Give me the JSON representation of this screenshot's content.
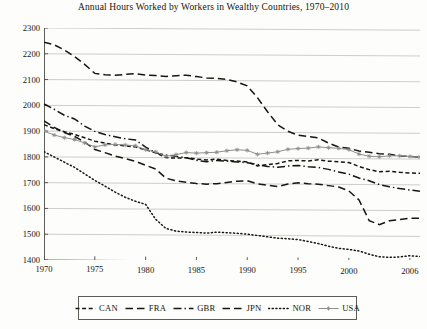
{
  "chart_data": {
    "type": "line",
    "title": "Annual Hours Worked by Workers in Wealthy Countries, 1970–2010",
    "xlabel": "",
    "ylabel": "",
    "xlim": [
      1970,
      2007
    ],
    "ylim": [
      1400,
      2300
    ],
    "ytick_labels": [
      "2300",
      "2200",
      "2100",
      "2000",
      "1900",
      "1800",
      "1700",
      "1600",
      "1500",
      "1400"
    ],
    "ytick_values": [
      2300,
      2200,
      2100,
      2000,
      1900,
      1800,
      1700,
      1600,
      1500,
      1400
    ],
    "xtick_labels": [
      "1970",
      "1975",
      "1980",
      "1985",
      "1990",
      "1995",
      "2000",
      "2006"
    ],
    "xtick_values": [
      1970,
      1975,
      1980,
      1985,
      1990,
      1995,
      2000,
      2006
    ],
    "grid": "horizontal",
    "legend_position": "below-axes",
    "x": [
      1970,
      1971,
      1972,
      1973,
      1974,
      1975,
      1976,
      1977,
      1978,
      1979,
      1980,
      1981,
      1982,
      1983,
      1984,
      1985,
      1986,
      1987,
      1988,
      1989,
      1990,
      1991,
      1992,
      1993,
      1994,
      1995,
      1996,
      1997,
      1998,
      1999,
      2000,
      2001,
      2002,
      2003,
      2004,
      2005,
      2006,
      2007
    ],
    "series": [
      {
        "name": "CAN",
        "style": "short-dash",
        "color": "#16160f",
        "values": [
          1925,
          1910,
          1898,
          1888,
          1875,
          1862,
          1855,
          1848,
          1845,
          1840,
          1830,
          1818,
          1800,
          1798,
          1800,
          1795,
          1792,
          1795,
          1790,
          1788,
          1785,
          1770,
          1775,
          1780,
          1790,
          1792,
          1790,
          1795,
          1790,
          1788,
          1785,
          1770,
          1758,
          1750,
          1752,
          1748,
          1746,
          1745
        ]
      },
      {
        "name": "FRA",
        "style": "long-dash",
        "color": "#16160f",
        "values": [
          1940,
          1915,
          1895,
          1880,
          1858,
          1830,
          1818,
          1805,
          1795,
          1785,
          1770,
          1755,
          1720,
          1710,
          1705,
          1700,
          1698,
          1700,
          1705,
          1710,
          1712,
          1700,
          1695,
          1690,
          1700,
          1705,
          1702,
          1700,
          1695,
          1690,
          1675,
          1640,
          1560,
          1545,
          1560,
          1565,
          1570,
          1570
        ]
      },
      {
        "name": "GBR",
        "style": "dash-dot",
        "color": "#16160f",
        "values": [
          2005,
          1985,
          1962,
          1948,
          1920,
          1900,
          1888,
          1880,
          1872,
          1868,
          1840,
          1818,
          1810,
          1805,
          1800,
          1790,
          1785,
          1790,
          1788,
          1785,
          1782,
          1775,
          1768,
          1765,
          1770,
          1772,
          1768,
          1765,
          1758,
          1748,
          1740,
          1725,
          1715,
          1700,
          1692,
          1685,
          1680,
          1675
        ]
      },
      {
        "name": "JPN",
        "style": "long-dash",
        "color": "#16160f",
        "values": [
          2245,
          2235,
          2215,
          2190,
          2160,
          2125,
          2120,
          2118,
          2122,
          2125,
          2120,
          2118,
          2115,
          2118,
          2120,
          2115,
          2110,
          2108,
          2105,
          2095,
          2080,
          2035,
          1980,
          1930,
          1905,
          1890,
          1885,
          1880,
          1860,
          1845,
          1840,
          1830,
          1825,
          1820,
          1818,
          1812,
          1810,
          1808
        ]
      },
      {
        "name": "NOR",
        "style": "dotted",
        "color": "#16160f",
        "values": [
          1820,
          1800,
          1780,
          1760,
          1735,
          1710,
          1688,
          1665,
          1645,
          1630,
          1618,
          1560,
          1525,
          1515,
          1512,
          1510,
          1508,
          1512,
          1510,
          1508,
          1505,
          1500,
          1495,
          1490,
          1488,
          1485,
          1478,
          1470,
          1460,
          1452,
          1448,
          1442,
          1430,
          1420,
          1418,
          1420,
          1425,
          1422
        ]
      },
      {
        "name": "USA",
        "style": "solid-marker",
        "color": "#8e8e8e",
        "values": [
          1900,
          1885,
          1875,
          1868,
          1855,
          1840,
          1848,
          1850,
          1848,
          1845,
          1830,
          1822,
          1805,
          1812,
          1820,
          1818,
          1820,
          1822,
          1828,
          1832,
          1830,
          1815,
          1820,
          1825,
          1835,
          1838,
          1840,
          1845,
          1842,
          1840,
          1835,
          1818,
          1810,
          1808,
          1812,
          1812,
          1810,
          1808
        ]
      }
    ]
  },
  "legend": {
    "items": [
      {
        "label": "CAN",
        "swatch": "short-dash-swatch"
      },
      {
        "label": "FRA",
        "swatch": "long-dash-swatch"
      },
      {
        "label": "GBR",
        "swatch": "dash-dot-swatch"
      },
      {
        "label": "JPN",
        "swatch": "long-dash-swatch"
      },
      {
        "label": "NOR",
        "swatch": "dotted-swatch"
      },
      {
        "label": "USA",
        "swatch": "solid-star-swatch"
      }
    ]
  }
}
